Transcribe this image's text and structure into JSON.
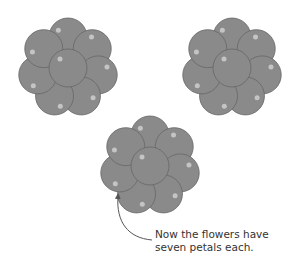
{
  "diagram": {
    "flowers": [
      {
        "id": "flower-left",
        "cx": 68,
        "cy": 68,
        "petals": 7
      },
      {
        "id": "flower-right",
        "cx": 232,
        "cy": 68,
        "petals": 7
      },
      {
        "id": "flower-bottom",
        "cx": 150,
        "cy": 166,
        "petals": 7
      }
    ],
    "colors": {
      "petal": "#8a8a8a",
      "outline": "#666666",
      "highlight": "#c4c4c4",
      "arrow": "#555555"
    },
    "caption": {
      "line1": "Now the flowers have",
      "line2": "seven petals each."
    }
  }
}
